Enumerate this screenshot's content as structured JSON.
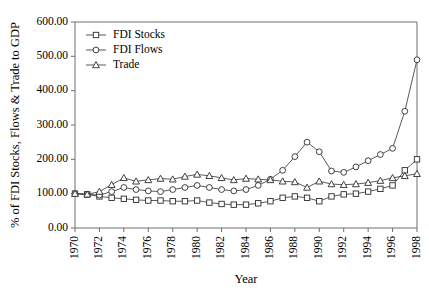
{
  "chart_data": {
    "type": "line",
    "title": "",
    "xlabel": "Year",
    "ylabel": "% of FDI Stocks, Flows & Trade to GDP",
    "xlim": [
      1970,
      1998
    ],
    "ylim": [
      0,
      600
    ],
    "ytick_labels": [
      "0.00",
      "100.00",
      "200.00",
      "300.00",
      "400.00",
      "500.00",
      "600.00"
    ],
    "ytick_values": [
      0,
      100,
      200,
      300,
      400,
      500,
      600
    ],
    "xtick_labels": [
      "1970",
      "1972",
      "1974",
      "1976",
      "1978",
      "1980",
      "1982",
      "1984",
      "1986",
      "1988",
      "1990",
      "1992",
      "1994",
      "1996",
      "1998"
    ],
    "xtick_values": [
      1970,
      1972,
      1974,
      1976,
      1978,
      1980,
      1982,
      1984,
      1986,
      1988,
      1990,
      1992,
      1994,
      1996,
      1998
    ],
    "grid": false,
    "legend_position": "top-left",
    "x": [
      1970,
      1971,
      1972,
      1973,
      1974,
      1975,
      1976,
      1977,
      1978,
      1979,
      1980,
      1981,
      1982,
      1983,
      1984,
      1985,
      1986,
      1987,
      1988,
      1989,
      1990,
      1991,
      1992,
      1993,
      1994,
      1995,
      1996,
      1997,
      1998
    ],
    "series": [
      {
        "name": "FDI Stocks",
        "marker": "square",
        "values": [
          100,
          98,
          92,
          88,
          85,
          82,
          80,
          80,
          78,
          78,
          80,
          74,
          70,
          68,
          68,
          72,
          78,
          88,
          92,
          88,
          78,
          92,
          98,
          100,
          106,
          114,
          124,
          168,
          200
        ]
      },
      {
        "name": "FDI Flows",
        "marker": "circle",
        "values": [
          100,
          98,
          96,
          106,
          118,
          112,
          108,
          106,
          112,
          118,
          124,
          118,
          112,
          108,
          112,
          124,
          142,
          168,
          208,
          250,
          222,
          166,
          162,
          178,
          196,
          214,
          232,
          340,
          490
        ]
      },
      {
        "name": "Trade",
        "marker": "triangle",
        "values": [
          100,
          98,
          106,
          126,
          146,
          136,
          140,
          144,
          142,
          150,
          156,
          152,
          146,
          140,
          144,
          142,
          140,
          136,
          134,
          118,
          136,
          128,
          126,
          128,
          132,
          138,
          146,
          152,
          158
        ]
      }
    ]
  },
  "legend": {
    "entries": [
      {
        "label": "FDI Stocks"
      },
      {
        "label": "FDI Flows"
      },
      {
        "label": "Trade"
      }
    ]
  }
}
